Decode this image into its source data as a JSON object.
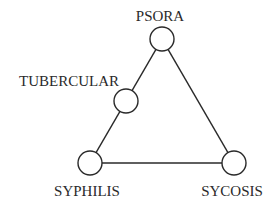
{
  "diagram": {
    "nodes": [
      {
        "id": "psora",
        "label": "PSORA",
        "cx": 162,
        "cy": 39,
        "r": 12,
        "lx": 160,
        "ly": 21
      },
      {
        "id": "tubercular",
        "label": "TUBERCULAR",
        "cx": 126,
        "cy": 101,
        "r": 12,
        "lx": 69,
        "ly": 86
      },
      {
        "id": "syphilis",
        "label": "SYPHILIS",
        "cx": 90,
        "cy": 163,
        "r": 12,
        "lx": 87,
        "ly": 196
      },
      {
        "id": "sycosis",
        "label": "SYCOSIS",
        "cx": 234,
        "cy": 163,
        "r": 12,
        "lx": 232,
        "ly": 196
      }
    ],
    "edges": [
      {
        "from": "psora",
        "to": "tubercular"
      },
      {
        "from": "tubercular",
        "to": "syphilis"
      },
      {
        "from": "syphilis",
        "to": "sycosis"
      },
      {
        "from": "sycosis",
        "to": "psora"
      }
    ],
    "colors": {
      "stroke": "#2a2a2a",
      "fill": "#ffffff"
    }
  }
}
